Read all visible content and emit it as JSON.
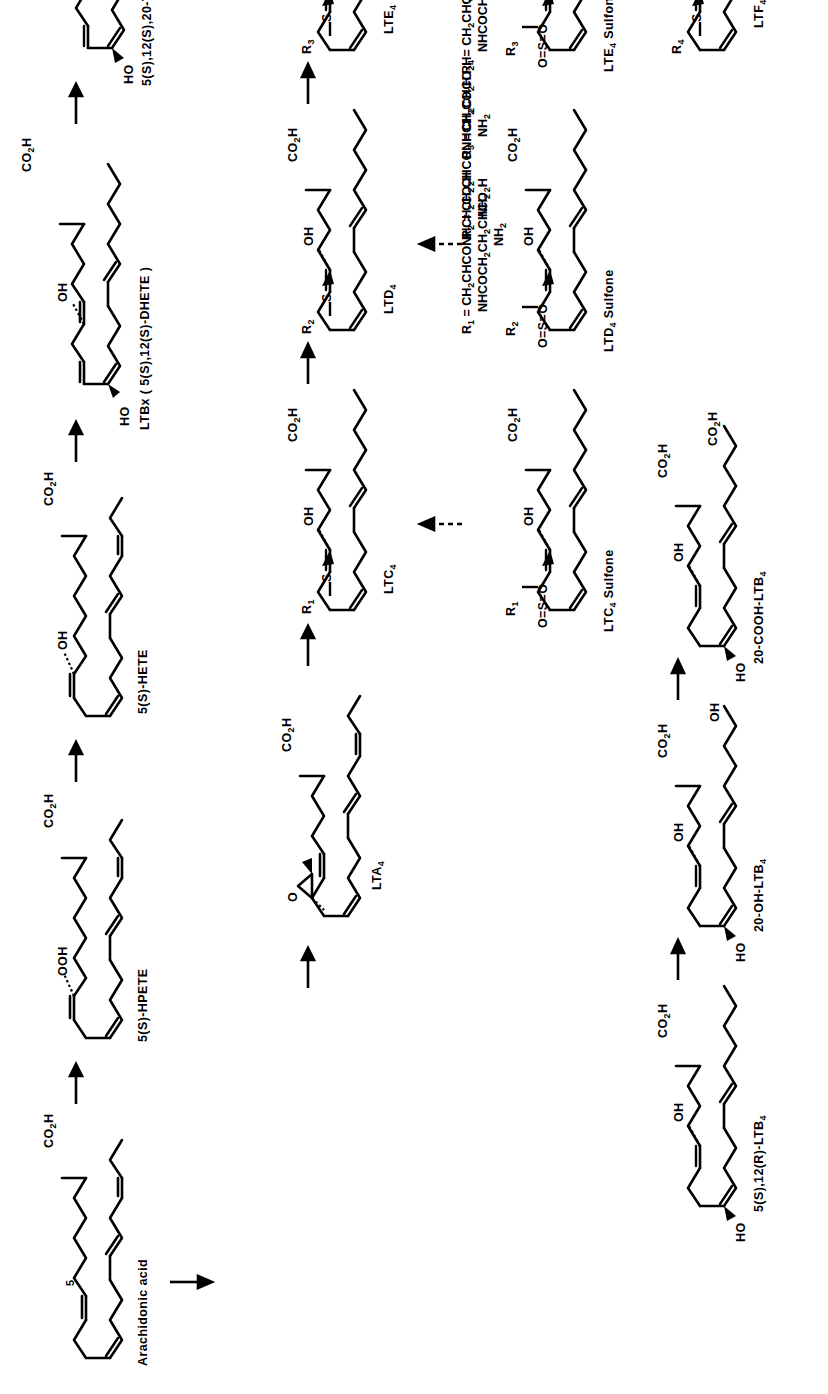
{
  "figure": {
    "orientation": "rotated-90-ccw",
    "ink_color": "#000000",
    "background_color": "#ffffff"
  },
  "structures": {
    "arachidonic_acid": {
      "label": "Arachidonic acid",
      "co2h": "CO2H",
      "position_number": "5"
    },
    "hpete": {
      "label": "5(S)-HPETE",
      "co2h": "CO2H",
      "ooh": "OOH"
    },
    "hete": {
      "label": "5(S)-HETE",
      "co2h": "CO2H",
      "oh": "OH"
    },
    "ltbx": {
      "label": "LTBx ( 5(S),12(S)-DHETE )",
      "co2h": "CO2H",
      "oh": "OH",
      "ho": "HO"
    },
    "thete": {
      "label": "5(S),12(S),20-THETE",
      "co2h": "CO2H",
      "oh": "OH",
      "oh2": "OH",
      "ho": "HO"
    },
    "lta4": {
      "label": "LTA4",
      "co2h": "CO2H",
      "epoxide_o": "O"
    },
    "ltb4": {
      "label": "5(S),12(R)-LTB4",
      "co2h": "CO2H",
      "oh": "OH",
      "ho": "HO"
    },
    "oh_ltb4": {
      "label": "20-OH-LTB4",
      "co2h": "CO2H",
      "oh": "OH",
      "oh2": "OH",
      "ho": "HO"
    },
    "cooh_ltb4": {
      "label": "20-COOH-LTB4",
      "co2h": "CO2H",
      "oh": "OH",
      "co2h2": "CO2H",
      "ho": "HO"
    },
    "ltc4": {
      "label": "LTC4",
      "co2h": "CO2H",
      "oh": "OH",
      "r": "R1",
      "s": "S"
    },
    "ltd4": {
      "label": "LTD4",
      "co2h": "CO2H",
      "oh": "OH",
      "r": "R2",
      "s": "S"
    },
    "lte4": {
      "label": "LTE4",
      "co2h": "CO2H",
      "oh": "OH",
      "r": "R3",
      "s": "S"
    },
    "ltf4": {
      "label": "LTF4",
      "co2h": "CO2H",
      "oh": "OH",
      "r": "R4",
      "s": "S"
    },
    "ltc4_sulfone": {
      "label": "LTC4 Sulfone",
      "co2h": "CO2H",
      "oh": "OH",
      "r": "R1",
      "sulfone": "O=S=O"
    },
    "ltd4_sulfone": {
      "label": "LTD4 Sulfone",
      "co2h": "CO2H",
      "oh": "OH",
      "r": "R2",
      "sulfone": "O=S=O"
    },
    "lte4_sulfone": {
      "label": "LTE4 Sulfone",
      "co2h": "CO2H",
      "oh": "OH",
      "r": "R3",
      "sulfone": "O=S=O"
    }
  },
  "r_groups": [
    {
      "name": "R1",
      "prefix": "R1 =",
      "line1": "CH2CHCONHCH2CO2H",
      "line2": "NHCOCH2CH2CHCO2H",
      "line3": "NH2"
    },
    {
      "name": "R2",
      "prefix": "R2 =",
      "line1": "CH2CHCONHCH2CO2H",
      "line2": "NH2",
      "line3": ""
    },
    {
      "name": "R3",
      "prefix": "R3 =",
      "line1": "CH2CHCO2H",
      "line2": "NH2",
      "line3": ""
    },
    {
      "name": "R4",
      "prefix": "R4 =",
      "line1": "CH2CHCO2H",
      "line2": "NHCOCH2CH2CHCO2H",
      "line3": "NH2"
    }
  ],
  "arrows": [
    {
      "id": "aa-to-hpete",
      "style": "solid",
      "direction": "right"
    },
    {
      "id": "hpete-to-hete",
      "style": "solid",
      "direction": "right"
    },
    {
      "id": "hete-to-ltbx",
      "style": "solid",
      "direction": "right"
    },
    {
      "id": "ltbx-to-thete",
      "style": "solid",
      "direction": "right"
    },
    {
      "id": "hpete-to-lta4",
      "style": "solid",
      "direction": "right"
    },
    {
      "id": "aa-to-ltb4",
      "style": "solid",
      "direction": "down"
    },
    {
      "id": "lta4-to-ltc4",
      "style": "solid",
      "direction": "right"
    },
    {
      "id": "ltc4-to-ltd4",
      "style": "solid",
      "direction": "right"
    },
    {
      "id": "ltd4-to-lte4",
      "style": "solid",
      "direction": "right"
    },
    {
      "id": "ltb4-to-20oh",
      "style": "solid",
      "direction": "right"
    },
    {
      "id": "20oh-to-20cooh",
      "style": "solid",
      "direction": "right"
    },
    {
      "id": "lte4-to-ltf4",
      "style": "solid",
      "direction": "down"
    },
    {
      "id": "ltc4-to-sulfone",
      "style": "dashed",
      "direction": "up"
    },
    {
      "id": "ltd4-to-sulfone",
      "style": "dashed",
      "direction": "up"
    },
    {
      "id": "lte4-to-sulfone",
      "style": "dashed",
      "direction": "up"
    }
  ]
}
